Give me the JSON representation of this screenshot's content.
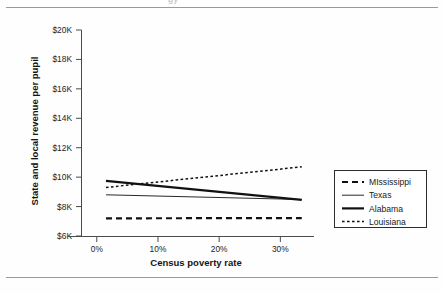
{
  "figure": {
    "clipped_top_fragment": "gy",
    "y_axis_title": "State and local revenue per pupil",
    "x_axis_title": "Census poverty rate"
  },
  "chart_data": {
    "type": "line",
    "title": "",
    "subtitle": "",
    "xlabel": "Census poverty rate",
    "ylabel": "State and local revenue per pupil",
    "xlim": [
      -2.5,
      35.5
    ],
    "ylim": [
      6000,
      20000
    ],
    "xticks": [
      0,
      10,
      20,
      30
    ],
    "xtick_labels": [
      "0%",
      "10%",
      "20%",
      "30%"
    ],
    "yticks": [
      6000,
      8000,
      10000,
      12000,
      14000,
      16000,
      18000,
      20000
    ],
    "ytick_labels": [
      "$6K",
      "$8K",
      "$10K",
      "$12K",
      "$14K",
      "$16K",
      "$18K",
      "$20K"
    ],
    "grid": false,
    "legend_position": "right-outside",
    "x": [
      1.5,
      33.5
    ],
    "series": [
      {
        "name": "MIssissippi",
        "style": "dashed-thick",
        "values": [
          7200,
          7220
        ]
      },
      {
        "name": "Texas",
        "style": "solid-thin",
        "values": [
          8800,
          8480
        ]
      },
      {
        "name": "Alabama",
        "style": "solid-thick",
        "values": [
          9750,
          8450
        ]
      },
      {
        "name": "Louisiana",
        "style": "dotted-fine",
        "values": [
          9300,
          10700
        ]
      }
    ]
  },
  "legend": {
    "items": [
      {
        "label": "MIssissippi"
      },
      {
        "label": "Texas"
      },
      {
        "label": "Alabama"
      },
      {
        "label": "Louisiana"
      }
    ]
  },
  "colors": {
    "ink": "#111111",
    "axis": "#4a4a4a",
    "page_rule": "#9a9a9a",
    "background": "#ffffff"
  }
}
